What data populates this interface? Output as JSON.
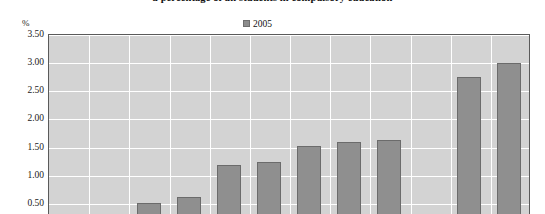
{
  "chart_data": {
    "type": "bar",
    "title": "a percentage of all students in compulsory education",
    "xlabel": "",
    "ylabel": "%",
    "ylim": [
      0,
      3.5
    ],
    "ytick_values": [
      3.5,
      3.0,
      2.5,
      2.0,
      1.5,
      1.0,
      0.5
    ],
    "ytick_labels": [
      "3.50",
      "3.00",
      "2.50",
      "2.00",
      "1.50",
      "1.00",
      "0.50"
    ],
    "grid": true,
    "legend_position": "top-center",
    "legend": [
      "2005"
    ],
    "categories": [
      "",
      "",
      "",
      "",
      "",
      "",
      "",
      "",
      "",
      "",
      "",
      ""
    ],
    "series": [
      {
        "name": "2005",
        "color": "#8f8f8f",
        "values": [
          null,
          null,
          0.48,
          0.58,
          1.15,
          1.2,
          1.5,
          1.56,
          1.6,
          null,
          2.72,
          2.96
        ]
      }
    ]
  },
  "axis": {
    "unit_label": "%"
  },
  "legend": {
    "entries": [
      {
        "label": "2005",
        "color": "#8f8f8f"
      }
    ]
  },
  "colors": {
    "plot_background": "#d3d3d3",
    "gridline": "#ffffff",
    "bar_fill": "#8f8f8f",
    "bar_border": "#6b6b6b",
    "frame": "#5a5a5a",
    "text": "#1a1a1a"
  }
}
